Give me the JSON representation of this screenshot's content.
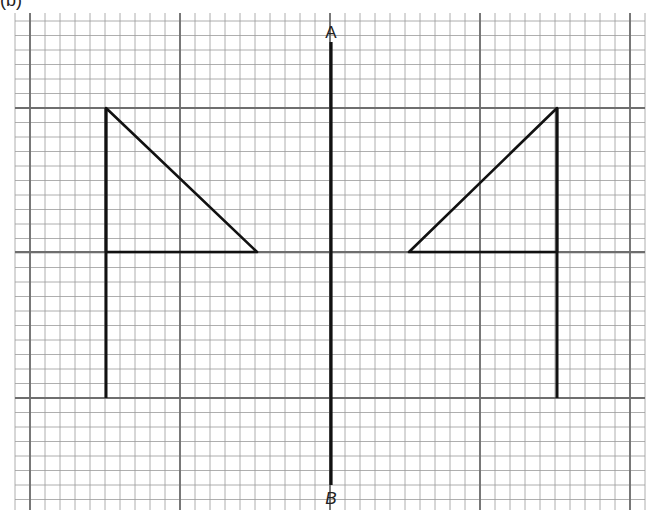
{
  "figure": {
    "label": "(b)",
    "grid": {
      "left": 15,
      "right": 645,
      "top": 13,
      "bottom": 510,
      "minor_x": 15.0,
      "minor_y": 14.5,
      "major_x": [
        30,
        180,
        330,
        480,
        630
      ],
      "major_y": [
        108,
        252,
        398
      ],
      "minor_color": "#9a9a9a",
      "major_color": "#6e6e6e"
    },
    "mirror_line": {
      "x": 331,
      "y1": 42,
      "y2": 485,
      "label_top": "A",
      "label_bottom": "B",
      "color": "#111111"
    },
    "shapes": [
      {
        "name": "left-flag",
        "pole": {
          "x": 106,
          "y1": 108,
          "y2": 398
        },
        "triangle": [
          [
            106,
            108
          ],
          [
            257,
            252
          ],
          [
            106,
            252
          ]
        ]
      },
      {
        "name": "right-flag-reflection",
        "pole": {
          "x": 557,
          "y1": 108,
          "y2": 398
        },
        "triangle": [
          [
            557,
            108
          ],
          [
            409,
            252
          ],
          [
            557,
            252
          ]
        ]
      }
    ]
  }
}
